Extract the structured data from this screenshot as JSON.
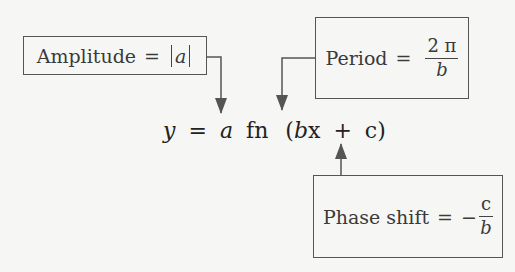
{
  "equation": {
    "lhs": "y",
    "equals": "=",
    "a": "a",
    "fn": "fn",
    "open": "(",
    "bx": "b",
    "x": "x",
    "plus": "+",
    "c": "c",
    "close": ")"
  },
  "amplitude": {
    "label": "Amplitude",
    "equals": "=",
    "value": "a"
  },
  "period": {
    "label": "Period",
    "equals": "=",
    "numerator": "2 π",
    "denominator": "b"
  },
  "phase_shift": {
    "label": "Phase shift",
    "equals": "=",
    "sign": "−",
    "numerator": "c",
    "denominator": "b"
  },
  "colors": {
    "background": "#f6f6f4",
    "line": "#555555",
    "text": "#3a3a3a"
  }
}
